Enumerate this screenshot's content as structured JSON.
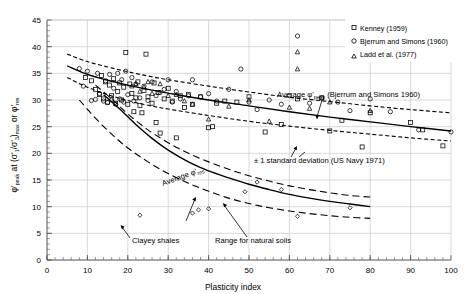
{
  "chart_data": {
    "type": "scatter",
    "title": "",
    "xlabel": "Plasticity index",
    "ylabel": "φ'peak at (σ'1/σ'3)max or φ'res",
    "xlim": [
      0,
      100
    ],
    "ylim": [
      0,
      45
    ],
    "xticks": [
      0,
      10,
      20,
      30,
      40,
      50,
      60,
      70,
      80,
      90,
      100
    ],
    "yticks": [
      0,
      5,
      10,
      15,
      20,
      25,
      30,
      35,
      40,
      45
    ],
    "x_minor_step": 2,
    "y_minor_step": 1,
    "grid": true,
    "grid_color": "#c8c8c8",
    "axis_color": "#555555",
    "legend_position": "top-right",
    "legend": [
      {
        "marker": "square",
        "label": "Kenney (1959)"
      },
      {
        "marker": "circle",
        "label": "Bjerrum and Simons (1960)"
      },
      {
        "marker": "triangle",
        "label": "Ladd et al. (1977)"
      }
    ],
    "series": [
      {
        "name": "Kenney (1959)",
        "marker": "square",
        "points": [
          [
            9.5,
            34.2
          ],
          [
            11,
            33.6
          ],
          [
            12,
            32.0
          ],
          [
            13,
            31.0
          ],
          [
            13.5,
            34.6
          ],
          [
            14,
            30.2
          ],
          [
            14.5,
            33.4
          ],
          [
            15,
            29.6
          ],
          [
            15.5,
            32.8
          ],
          [
            16,
            30.8
          ],
          [
            16.5,
            34.0
          ],
          [
            17,
            29.4
          ],
          [
            17.5,
            31.6
          ],
          [
            18,
            33.2
          ],
          [
            18.5,
            30.0
          ],
          [
            19,
            32.4
          ],
          [
            19.5,
            38.9
          ],
          [
            20,
            29.2
          ],
          [
            20.5,
            33.0
          ],
          [
            21,
            31.2
          ],
          [
            21.5,
            27.8
          ],
          [
            22,
            30.4
          ],
          [
            22.5,
            33.4
          ],
          [
            23,
            29.0
          ],
          [
            23.5,
            27.6
          ],
          [
            24,
            31.8
          ],
          [
            24.5,
            38.6
          ],
          [
            25,
            30.6
          ],
          [
            26,
            29.4
          ],
          [
            26.5,
            33.2
          ],
          [
            27,
            25.8
          ],
          [
            27.5,
            31.4
          ],
          [
            28,
            23.8
          ],
          [
            29,
            30.2
          ],
          [
            30,
            32.2
          ],
          [
            31,
            29.8
          ],
          [
            32,
            22.9
          ],
          [
            33,
            30.8
          ],
          [
            34,
            28.6
          ],
          [
            35,
            31.0
          ],
          [
            36,
            29.2
          ],
          [
            38,
            30.6
          ],
          [
            40,
            24.8
          ],
          [
            41,
            25.0
          ],
          [
            42,
            29.4
          ],
          [
            44,
            29.8
          ],
          [
            47,
            29.6
          ],
          [
            50,
            30.6
          ],
          [
            54,
            24.0
          ],
          [
            58,
            25.4
          ],
          [
            62,
            30.2
          ],
          [
            68,
            30.4
          ],
          [
            70,
            24.2
          ],
          [
            73,
            26.2
          ],
          [
            78,
            21.2
          ],
          [
            80,
            27.6
          ],
          [
            90,
            25.8
          ],
          [
            93,
            24.4
          ],
          [
            98,
            21.4
          ]
        ]
      },
      {
        "name": "Bjerrum and Simons (1960)",
        "marker": "circle",
        "points": [
          [
            8,
            35.9
          ],
          [
            9,
            32.6
          ],
          [
            10,
            35.4
          ],
          [
            11,
            29.9
          ],
          [
            12,
            30.1
          ],
          [
            12.5,
            35.0
          ],
          [
            13,
            31.2
          ],
          [
            14,
            29.8
          ],
          [
            14.5,
            33.6
          ],
          [
            15,
            29.5
          ],
          [
            15.5,
            34.8
          ],
          [
            16,
            30.0
          ],
          [
            16.5,
            32.2
          ],
          [
            17,
            29.2
          ],
          [
            17.5,
            35.0
          ],
          [
            18,
            30.2
          ],
          [
            18.5,
            33.8
          ],
          [
            19,
            29.6
          ],
          [
            19.5,
            35.4
          ],
          [
            20,
            31.0
          ],
          [
            21,
            34.2
          ],
          [
            21.5,
            29.8
          ],
          [
            22,
            33.0
          ],
          [
            23,
            30.4
          ],
          [
            24,
            32.6
          ],
          [
            25,
            29.9
          ],
          [
            26,
            33.4
          ],
          [
            27,
            30.8
          ],
          [
            28,
            31.4
          ],
          [
            29,
            32.0
          ],
          [
            30,
            33.8
          ],
          [
            31,
            29.6
          ],
          [
            32,
            31.6
          ],
          [
            33,
            30.2
          ],
          [
            35,
            30.8
          ],
          [
            36,
            33.8
          ],
          [
            38,
            30.6
          ],
          [
            40,
            31.2
          ],
          [
            42,
            29.8
          ],
          [
            45,
            32.0
          ],
          [
            48,
            35.8
          ],
          [
            50,
            29.6
          ],
          [
            52,
            28.2
          ],
          [
            55,
            30.0
          ],
          [
            58,
            29.2
          ],
          [
            60,
            30.8
          ],
          [
            62,
            42.0
          ],
          [
            65,
            29.4
          ],
          [
            68,
            30.4
          ],
          [
            72,
            29.6
          ],
          [
            75,
            28.0
          ],
          [
            80,
            30.2
          ],
          [
            85,
            27.8
          ],
          [
            92,
            24.4
          ],
          [
            100,
            24.0
          ]
        ]
      },
      {
        "name": "Ladd et al. (1977)",
        "marker": "triangle",
        "points": [
          [
            21,
            32.6
          ],
          [
            22,
            33.0
          ],
          [
            23,
            31.6
          ],
          [
            24,
            32.4
          ],
          [
            25,
            33.4
          ],
          [
            26,
            31.2
          ],
          [
            28,
            33.0
          ],
          [
            30,
            30.8
          ],
          [
            32,
            31.0
          ],
          [
            34,
            29.8
          ],
          [
            36,
            29.2
          ],
          [
            40,
            26.4
          ],
          [
            45,
            28.8
          ],
          [
            50,
            30.0
          ],
          [
            55,
            26.0
          ],
          [
            60,
            28.6
          ],
          [
            62,
            39.0
          ],
          [
            62,
            35.8
          ],
          [
            65,
            28.4
          ],
          [
            70,
            29.6
          ],
          [
            80,
            28.0
          ]
        ]
      },
      {
        "name": "Clayey shales",
        "marker": "diamond",
        "points": [
          [
            23,
            8.4
          ],
          [
            36,
            8.8
          ],
          [
            37.5,
            9.4
          ],
          [
            40,
            9.6
          ],
          [
            49,
            12.8
          ],
          [
            52,
            14.6
          ],
          [
            58,
            13.2
          ],
          [
            62,
            8.2
          ],
          [
            75,
            9.8
          ]
        ]
      }
    ],
    "curves": [
      {
        "name": "Average phi peak (Bjerrum and Simons 1960)",
        "style": "solid",
        "points": [
          [
            5,
            36.4
          ],
          [
            10,
            34.8
          ],
          [
            15,
            33.7
          ],
          [
            20,
            32.8
          ],
          [
            25,
            32.0
          ],
          [
            30,
            31.3
          ],
          [
            40,
            30.0
          ],
          [
            50,
            28.9
          ],
          [
            60,
            27.8
          ],
          [
            70,
            26.8
          ],
          [
            80,
            25.9
          ],
          [
            90,
            25.0
          ],
          [
            100,
            24.2
          ]
        ]
      },
      {
        "name": "Upper +1 std dev (peak)",
        "style": "dashed",
        "points": [
          [
            5,
            38.6
          ],
          [
            10,
            37.2
          ],
          [
            15,
            36.2
          ],
          [
            20,
            35.3
          ],
          [
            25,
            34.5
          ],
          [
            30,
            33.8
          ],
          [
            40,
            32.6
          ],
          [
            50,
            31.5
          ],
          [
            60,
            30.5
          ],
          [
            70,
            29.7
          ],
          [
            80,
            28.9
          ],
          [
            90,
            28.2
          ],
          [
            100,
            27.6
          ]
        ]
      },
      {
        "name": "Lower -1 std dev (peak)",
        "style": "dashed",
        "points": [
          [
            5,
            34.2
          ],
          [
            10,
            32.4
          ],
          [
            15,
            31.0
          ],
          [
            20,
            29.9
          ],
          [
            25,
            29.0
          ],
          [
            30,
            28.3
          ],
          [
            40,
            27.1
          ],
          [
            50,
            26.0
          ],
          [
            60,
            25.1
          ],
          [
            70,
            24.3
          ],
          [
            80,
            23.6
          ],
          [
            90,
            22.9
          ],
          [
            100,
            22.3
          ]
        ]
      },
      {
        "name": "Average phi res",
        "style": "solid",
        "points": [
          [
            14,
            31.0
          ],
          [
            18,
            28.3
          ],
          [
            22,
            25.4
          ],
          [
            26,
            22.8
          ],
          [
            30,
            20.6
          ],
          [
            35,
            18.4
          ],
          [
            40,
            16.7
          ],
          [
            45,
            15.4
          ],
          [
            50,
            14.2
          ],
          [
            55,
            13.2
          ],
          [
            60,
            12.3
          ],
          [
            65,
            11.6
          ],
          [
            70,
            11.0
          ],
          [
            75,
            10.5
          ],
          [
            80,
            10.0
          ]
        ]
      },
      {
        "name": "Range for natural soils upper",
        "style": "longdash",
        "points": [
          [
            12,
            32.8
          ],
          [
            16,
            30.2
          ],
          [
            20,
            27.4
          ],
          [
            25,
            24.4
          ],
          [
            30,
            22.0
          ],
          [
            35,
            20.0
          ],
          [
            40,
            18.4
          ],
          [
            45,
            17.0
          ],
          [
            50,
            15.8
          ],
          [
            55,
            14.8
          ],
          [
            60,
            13.9
          ],
          [
            65,
            13.2
          ],
          [
            70,
            12.6
          ],
          [
            75,
            12.1
          ],
          [
            80,
            11.8
          ]
        ]
      },
      {
        "name": "Range for natural soils lower",
        "style": "longdash",
        "points": [
          [
            8,
            30.0
          ],
          [
            12,
            26.6
          ],
          [
            16,
            23.6
          ],
          [
            20,
            21.0
          ],
          [
            25,
            18.4
          ],
          [
            30,
            16.2
          ],
          [
            35,
            14.4
          ],
          [
            40,
            12.9
          ],
          [
            45,
            11.6
          ],
          [
            50,
            10.6
          ],
          [
            55,
            9.8
          ],
          [
            60,
            9.2
          ],
          [
            65,
            8.7
          ],
          [
            70,
            8.3
          ],
          [
            75,
            8.0
          ],
          [
            80,
            7.8
          ]
        ]
      }
    ],
    "annotations": [
      {
        "id": "avg-peak",
        "text": "Average φ'peak (Bjerrum and Simons 1960)"
      },
      {
        "id": "std-dev",
        "text": "± 1 standard deviation (US Navy 1971)"
      },
      {
        "id": "avg-res",
        "text": "Average φ'res"
      },
      {
        "id": "clayey-shales",
        "text": "Clayey shales"
      },
      {
        "id": "range-natural",
        "text": "Range for natural soils"
      }
    ]
  },
  "labels": {
    "xaxis": "Plasticity index",
    "y_phi": "φ'",
    "y_peak": "peak",
    "y_at": " at  (",
    "y_sig1": "σ'",
    "y_one": "1",
    "y_slash": "/",
    "y_sig3": "σ'",
    "y_three": "3",
    "y_closemax": ")",
    "y_max": "max",
    "y_or": " or  ",
    "y_phi2": "φ'",
    "y_res": "res",
    "xticks": [
      "0",
      "10",
      "20",
      "30",
      "40",
      "50",
      "60",
      "70",
      "80",
      "90",
      "100"
    ],
    "yticks": [
      "0",
      "5",
      "10",
      "15",
      "20",
      "25",
      "30",
      "35",
      "40",
      "45"
    ],
    "legend_kenney": "Kenney (1959)",
    "legend_bjerrum": "Bjerrum and Simons (1960)",
    "legend_ladd": "Ladd et al. (1977)",
    "annot_avg_peak_1": "Average ",
    "annot_avg_peak_phi": "φ'",
    "annot_avg_peak_sub": "peak",
    "annot_avg_peak_2": " (Bjerrum and Simons 1960)",
    "annot_std": "± 1 standard deviation (US Navy 1971)",
    "annot_avg_res_1": "Average ",
    "annot_avg_res_phi": "φ'",
    "annot_avg_res_sub": "res",
    "annot_clayey": "Clayey shales",
    "annot_range": "Range for natural soils"
  },
  "colors": {
    "grid": "#c9c9c9",
    "axis": "#5a5a5a",
    "data": "#000000",
    "background": "#ffffff"
  }
}
